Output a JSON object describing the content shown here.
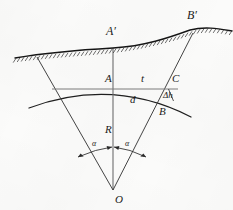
{
  "figure": {
    "background_color": "#fbfbfa",
    "ink_color": "#1b1b1b"
  },
  "labels": {
    "a_prime": "A′",
    "b_prime": "B′",
    "a": "A",
    "b": "B",
    "c": "C",
    "o": "O",
    "t": "t",
    "d": "d",
    "r": "R",
    "delta_h": "Δh",
    "alpha_left": "α",
    "alpha_right": "α"
  },
  "geometry": {
    "center_o": {
      "x": 113,
      "y": 190
    },
    "point_a": {
      "x": 113,
      "y": 89
    },
    "point_c": {
      "x": 176,
      "y": 89
    },
    "point_b": {
      "x": 172,
      "y": 101
    },
    "point_a_prime": {
      "x": 113,
      "y": 48
    },
    "point_b_prime": {
      "x": 193,
      "y": 33
    },
    "chord_line": {
      "x1": 52,
      "y1": 89,
      "x2": 178,
      "y2": 89
    },
    "arc_radius": 101,
    "half_angle_deg": 22
  }
}
